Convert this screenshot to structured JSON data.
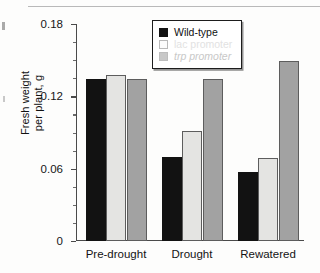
{
  "chart_data": {
    "type": "bar",
    "title": "",
    "xlabel": "",
    "ylabel_line1": "Fresh weight",
    "ylabel_line2": "per plant, g",
    "ylim": [
      0,
      0.18
    ],
    "yticks": [
      "0",
      "0.06",
      "0.12",
      "0.18"
    ],
    "ytick_values": [
      0,
      0.06,
      0.12,
      0.18
    ],
    "minor_tick_step": 0.015,
    "grid": false,
    "legend_position": "top-center",
    "categories": [
      "Pre-drought",
      "Drought",
      "Rewatered"
    ],
    "series": [
      {
        "name": "Wild-type",
        "color": "#121212",
        "values": [
          0.134,
          0.07,
          0.057
        ]
      },
      {
        "name": "lac promoter",
        "color": "#e4e4e2",
        "values": [
          0.138,
          0.091,
          0.069
        ]
      },
      {
        "name": "trp promoter",
        "color": "#a2a2a2",
        "values": [
          0.134,
          0.134,
          0.149
        ]
      }
    ]
  },
  "legend": {
    "items": [
      {
        "label": "Wild-type",
        "style": "solid-black"
      },
      {
        "label": "lac promoter",
        "style": "open-white"
      },
      {
        "label": "trp promoter",
        "style": "solid-gray"
      }
    ]
  }
}
